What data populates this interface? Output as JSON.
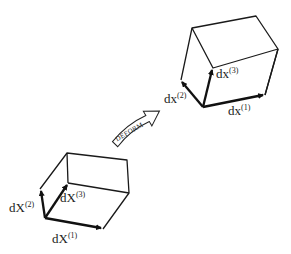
{
  "diagram": {
    "title": "",
    "arrow_label": "DEFORM",
    "reference_box": {
      "labels": {
        "v1": {
          "base": "dX",
          "sup": "(1)"
        },
        "v2": {
          "base": "dX",
          "sup": "(2)"
        },
        "v3": {
          "base": "dX",
          "sup": "(3)"
        }
      }
    },
    "deformed_box": {
      "labels": {
        "v1": {
          "base": "dx",
          "sup": "(1)"
        },
        "v2": {
          "base": "dx",
          "sup": "(2)"
        },
        "v3": {
          "base": "dx",
          "sup": "(3)"
        }
      }
    },
    "colors": {
      "stroke": "#1a1a1a",
      "background": "#ffffff"
    }
  }
}
